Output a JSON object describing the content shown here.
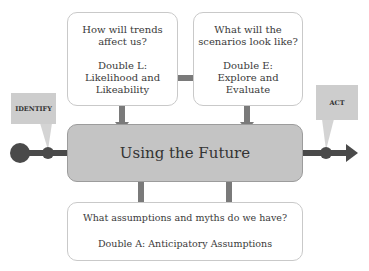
{
  "diagram": {
    "center": {
      "label": "Using the Future",
      "fill": "#c4c4c4"
    },
    "boxes": {
      "double_l": {
        "question": [
          "How will trends",
          "affect us?"
        ],
        "title": [
          "Double L:",
          "Likelihood and",
          "Likeability"
        ]
      },
      "double_e": {
        "question": [
          "What will the",
          "scenarios look like?"
        ],
        "title": [
          "Double E:",
          "Explore and",
          "Evaluate"
        ]
      },
      "double_a": {
        "question": "What assumptions and myths do we have?",
        "title": "Double A: Anticipatory Assumptions"
      }
    },
    "callouts": {
      "identify": "IDENTIFY",
      "act": "ACT"
    },
    "colors": {
      "arrow": "#777777",
      "line": "#4a4a4a",
      "callout": "#cdcdcd",
      "border": "#c9c9c9"
    }
  }
}
